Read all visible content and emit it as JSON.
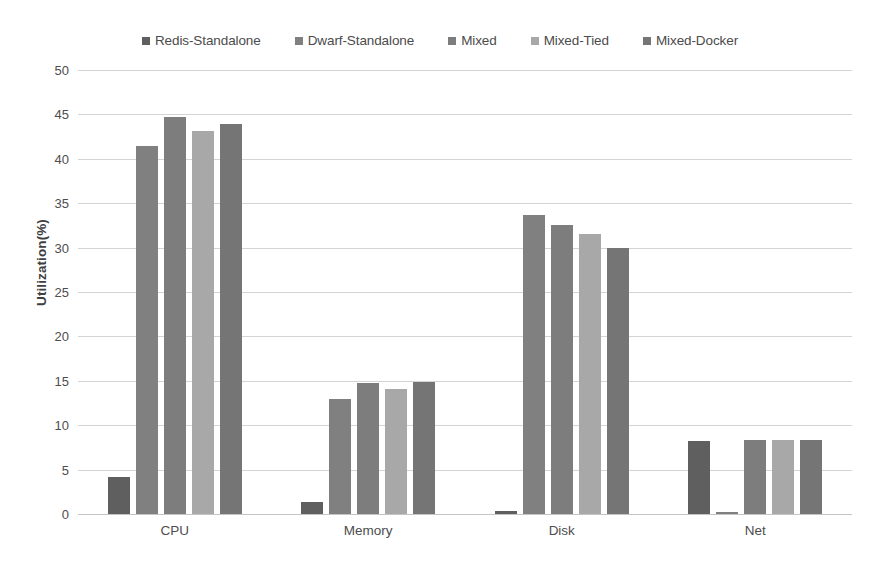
{
  "chart_data": {
    "type": "bar",
    "title": "",
    "xlabel": "",
    "ylabel": "Utilization(%)",
    "ylim": [
      0,
      50
    ],
    "yticks": [
      0,
      5,
      10,
      15,
      20,
      25,
      30,
      35,
      40,
      45,
      50
    ],
    "grid": true,
    "legend_position": "top",
    "categories": [
      "CPU",
      "Memory",
      "Disk",
      "Net"
    ],
    "series": [
      {
        "name": "Redis-Standalone",
        "color": "#5f5f5f",
        "values": [
          4.2,
          1.4,
          0.3,
          8.2
        ]
      },
      {
        "name": "Dwarf-Standalone",
        "color": "#808080",
        "values": [
          41.4,
          13.0,
          33.7,
          0.2
        ]
      },
      {
        "name": "Mixed",
        "color": "#7d7d7d",
        "values": [
          44.7,
          14.8,
          32.6,
          8.3
        ]
      },
      {
        "name": "Mixed-Tied",
        "color": "#a8a8a8",
        "values": [
          43.1,
          14.1,
          31.5,
          8.3
        ]
      },
      {
        "name": "Mixed-Docker",
        "color": "#757575",
        "values": [
          43.9,
          14.9,
          30.0,
          8.3
        ]
      }
    ]
  }
}
